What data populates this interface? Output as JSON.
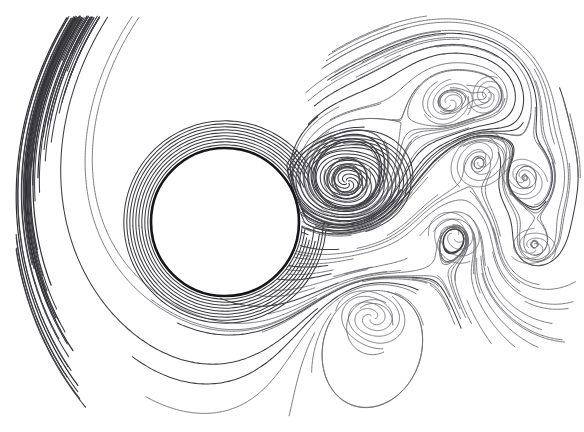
{
  "figure": {
    "caption": "",
    "background_color": "#ffffff",
    "line_color": "#3d3d42",
    "faint_line_color": "#6b6b72",
    "strong_line_color": "#2e2e33",
    "cylinder_stroke_color": "#15151a",
    "canvas_width": 584,
    "canvas_height": 432
  },
  "chart_data": {
    "type": "line",
    "subtitle": "",
    "xlabel": "",
    "ylabel": "",
    "xlim": [
      0,
      584
    ],
    "ylim": [
      0,
      432
    ],
    "grid": false,
    "legend": "none",
    "annotations": [],
    "tick_labels_x": [],
    "tick_labels_y": [],
    "obstacle": {
      "shape": "circle",
      "center_x": 225,
      "center_y": 222,
      "radius": 74,
      "stroke_width": 2.6,
      "fill": "#ffffff"
    },
    "flow_direction": "left-to-right",
    "field_bounds": {
      "left": 22,
      "right": 578,
      "top": 26,
      "bottom": 408
    },
    "vortices": [
      {
        "name": "primary-near-wake-vortex",
        "cx": 347,
        "cy": 182,
        "turns": 3.1,
        "r0": 2,
        "r1": 62,
        "rotation": "clockwise",
        "phase": 0.6
      },
      {
        "name": "secondary-lower-wake-vortex",
        "cx": 372,
        "cy": 318,
        "turns": 1.5,
        "r0": 3,
        "r1": 34,
        "rotation": "counterclockwise",
        "phase": 2.3
      },
      {
        "name": "upper-shear-eddy-a",
        "cx": 449,
        "cy": 103,
        "turns": 1.25,
        "r0": 3,
        "r1": 25,
        "rotation": "clockwise",
        "phase": 1.1
      },
      {
        "name": "upper-shear-eddy-b",
        "cx": 487,
        "cy": 96,
        "turns": 1.05,
        "r0": 3,
        "r1": 20,
        "rotation": "clockwise",
        "phase": 2.8
      },
      {
        "name": "right-mid-eddy-a",
        "cx": 480,
        "cy": 160,
        "turns": 1.35,
        "r0": 3,
        "r1": 32,
        "rotation": "counterclockwise",
        "phase": 0.2
      },
      {
        "name": "right-mid-eddy-b",
        "cx": 523,
        "cy": 178,
        "turns": 1.15,
        "r0": 3,
        "r1": 24,
        "rotation": "clockwise",
        "phase": 3.4
      },
      {
        "name": "right-lower-eddy",
        "cx": 455,
        "cy": 236,
        "turns": 1.1,
        "r0": 4,
        "r1": 28,
        "rotation": "counterclockwise",
        "phase": 1.7
      },
      {
        "name": "far-right-eddy",
        "cx": 533,
        "cy": 247,
        "turns": 0.95,
        "r0": 4,
        "r1": 22,
        "rotation": "clockwise",
        "phase": 0.9
      }
    ],
    "streamline_bands": [
      {
        "name": "upper-laminar-band",
        "count": 22,
        "y_start": 30,
        "y_end": 200,
        "note": "smooth deflected streamlines above the cylinder"
      },
      {
        "name": "lower-laminar-band",
        "count": 24,
        "y_start": 250,
        "y_end": 405,
        "note": "smooth deflected streamlines below the cylinder"
      },
      {
        "name": "wake-turbulent-band",
        "count": 30,
        "y_start": 60,
        "y_end": 330,
        "note": "chaotic eddying streamlines downstream of the cylinder"
      }
    ],
    "series": [
      {
        "name": "upstream-laminar-streamlines",
        "description": "Parallel streamlines entering from the left, deflecting smoothly around the cylinder",
        "values": []
      },
      {
        "name": "wake-vortex-streamlines",
        "description": "Spiral and recirculating streamlines forming the unsteady wake",
        "values": []
      },
      {
        "name": "downstream-recovery-streamlines",
        "description": "Streamlines relaxing back toward horizontal far downstream",
        "values": []
      }
    ]
  }
}
